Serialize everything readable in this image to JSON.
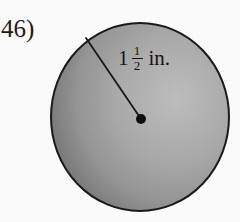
{
  "problem": {
    "number_label": "46)"
  },
  "figure": {
    "shape": "circle",
    "shape_icon": "circle-shape",
    "center_marker": "center-dot",
    "radius_line": "radius-segment",
    "measurement": {
      "whole": "1",
      "numerator": "1",
      "denominator": "2",
      "unit": "in.",
      "full_text": "1 1/2 in."
    }
  },
  "colors": {
    "background": "#fbfbfb",
    "circle_fill_light": "#b4b4b4",
    "circle_fill_mid": "#9a9a9a",
    "circle_fill_dark": "#777777",
    "outline": "#1a1a1a",
    "text": "#141414"
  }
}
